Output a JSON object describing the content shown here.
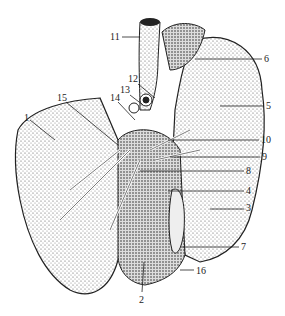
{
  "figure": {
    "colors": {
      "ink": "#222222",
      "background": "#ffffff",
      "stipple": "#555555"
    },
    "labels": [
      {
        "num": "1",
        "x": 24,
        "y": 113,
        "lx1": 30,
        "ly1": 120,
        "lx2": 55,
        "ly2": 140
      },
      {
        "num": "2",
        "x": 139,
        "y": 295,
        "lx1": 142,
        "ly1": 292,
        "lx2": 144,
        "ly2": 262
      },
      {
        "num": "3",
        "x": 246,
        "y": 203,
        "lx1": 244,
        "ly1": 209,
        "lx2": 210,
        "ly2": 209
      },
      {
        "num": "4",
        "x": 246,
        "y": 186,
        "lx1": 244,
        "ly1": 191,
        "lx2": 168,
        "ly2": 191
      },
      {
        "num": "5",
        "x": 266,
        "y": 101,
        "lx1": 264,
        "ly1": 106,
        "lx2": 220,
        "ly2": 106
      },
      {
        "num": "6",
        "x": 264,
        "y": 54,
        "lx1": 262,
        "ly1": 59,
        "lx2": 195,
        "ly2": 59
      },
      {
        "num": "7",
        "x": 241,
        "y": 242,
        "lx1": 239,
        "ly1": 247,
        "lx2": 182,
        "ly2": 247
      },
      {
        "num": "8",
        "x": 246,
        "y": 166,
        "lx1": 244,
        "ly1": 171,
        "lx2": 140,
        "ly2": 171
      },
      {
        "num": "9",
        "x": 262,
        "y": 152,
        "lx1": 260,
        "ly1": 157,
        "lx2": 170,
        "ly2": 157
      },
      {
        "num": "10",
        "x": 261,
        "y": 135,
        "lx1": 259,
        "ly1": 140,
        "lx2": 168,
        "ly2": 140
      },
      {
        "num": "11",
        "x": 110,
        "y": 32,
        "lx1": 122,
        "ly1": 37,
        "lx2": 140,
        "ly2": 37
      },
      {
        "num": "12",
        "x": 128,
        "y": 74,
        "lx1": 138,
        "ly1": 84,
        "lx2": 155,
        "ly2": 98
      },
      {
        "num": "13",
        "x": 120,
        "y": 85,
        "lx1": 130,
        "ly1": 95,
        "lx2": 143,
        "ly2": 105
      },
      {
        "num": "14",
        "x": 110,
        "y": 93,
        "lx1": 118,
        "ly1": 102,
        "lx2": 135,
        "ly2": 120
      },
      {
        "num": "15",
        "x": 57,
        "y": 93,
        "lx1": 66,
        "ly1": 102,
        "lx2": 118,
        "ly2": 145
      },
      {
        "num": "16",
        "x": 196,
        "y": 266,
        "lx1": 194,
        "ly1": 270,
        "lx2": 180,
        "ly2": 270
      }
    ]
  }
}
